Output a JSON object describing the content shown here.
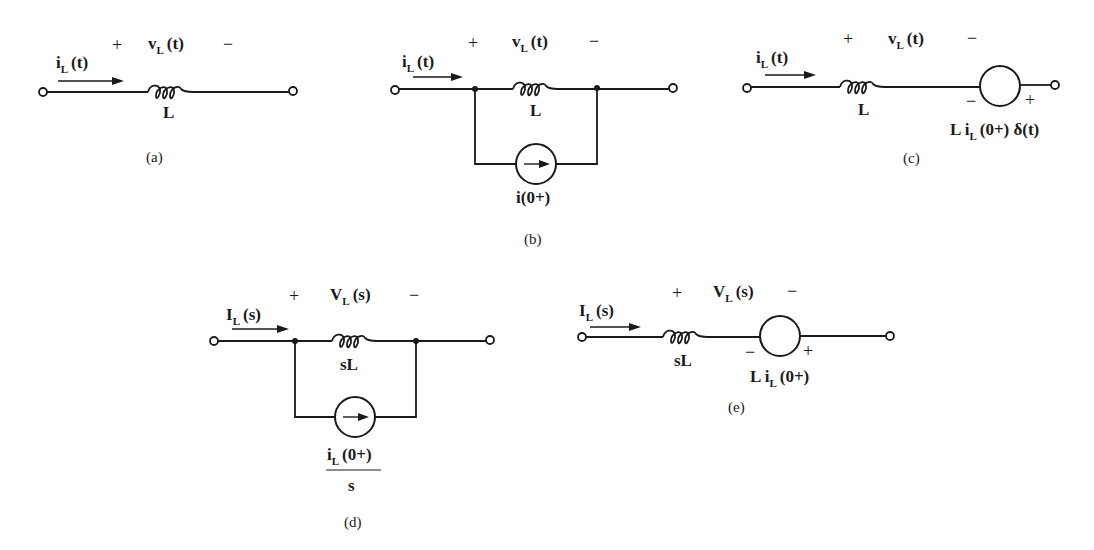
{
  "figure": {
    "subfigures": {
      "a": {
        "caption": "(a)",
        "current_label": "i",
        "current_sub": "L",
        "current_arg": "(t)",
        "voltage_label": "v",
        "voltage_sub": "L",
        "voltage_arg": "(t)",
        "plus": "+",
        "minus": "−",
        "inductor_label": "L"
      },
      "b": {
        "caption": "(b)",
        "current_label": "i",
        "current_sub": "L",
        "current_arg": "(t)",
        "voltage_label": "v",
        "voltage_sub": "L",
        "voltage_arg": "(t)",
        "plus": "+",
        "minus": "−",
        "inductor_label": "L",
        "source_label": "i(0+)"
      },
      "c": {
        "caption": "(c)",
        "current_label": "i",
        "current_sub": "L",
        "current_arg": "(t)",
        "voltage_label": "v",
        "voltage_sub": "L",
        "voltage_arg": "(t)",
        "plus": "+",
        "minus": "−",
        "inductor_label": "L",
        "source_minus": "−",
        "source_plus": "+",
        "source_pre": "L i",
        "source_sub": "L",
        "source_post": "(0+) δ(t)"
      },
      "d": {
        "caption": "(d)",
        "current_label": "I",
        "current_sub": "L",
        "current_arg": "(s)",
        "voltage_label": "V",
        "voltage_sub": "L",
        "voltage_arg": "(s)",
        "plus": "+",
        "minus": "−",
        "inductor_label": "sL",
        "source_num_pre": "i",
        "source_num_sub": "L",
        "source_num_post": "(0+)",
        "source_den": "s"
      },
      "e": {
        "caption": "(e)",
        "current_label": "I",
        "current_sub": "L",
        "current_arg": "(s)",
        "voltage_label": "V",
        "voltage_sub": "L",
        "voltage_arg": "(s)",
        "plus": "+",
        "minus": "−",
        "inductor_label": "sL",
        "source_minus": "−",
        "source_plus": "+",
        "source_pre": "L i",
        "source_sub": "L",
        "source_post": "(0+)"
      }
    }
  }
}
